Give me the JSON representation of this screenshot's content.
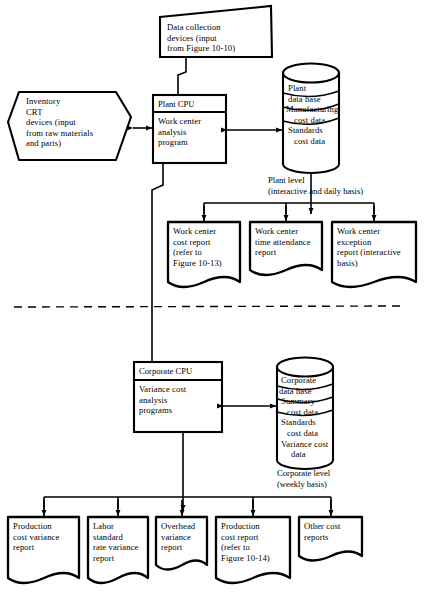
{
  "diagram": {
    "divider_note": "dashed horizontal separator between plant level and corporate level"
  },
  "nodes": {
    "data_collection": {
      "shape": "skewed-parallelogram",
      "lines": [
        "Data collection",
        "devices (input",
        "from Figure 10-10)"
      ]
    },
    "inventory_crt": {
      "shape": "hexagon",
      "lines": [
        "Inventory",
        "CRT",
        "devices (input",
        "from raw materials",
        "and parts)"
      ]
    },
    "plant_cpu": {
      "shape": "process-box",
      "header": "Plant CPU",
      "lines": [
        "Work center",
        "analysis",
        "program"
      ]
    },
    "plant_db": {
      "shape": "cylinder",
      "lines": [
        "Plant",
        "data base",
        "Manufacturing",
        "cost data",
        "Standards",
        "cost data"
      ]
    },
    "plant_level_label": {
      "lines": [
        "Plant level",
        "(interactive and daily basis)"
      ]
    },
    "corporate_cpu": {
      "shape": "process-box",
      "header": "Corporate CPU",
      "lines": [
        "Variance cost",
        "analysis",
        "programs"
      ]
    },
    "corporate_db": {
      "shape": "cylinder",
      "lines": [
        "Corporate",
        "data base",
        "Summary",
        "cost data",
        "Standards",
        "cost data",
        "Variance cost",
        "data"
      ]
    },
    "corporate_level_label": {
      "lines": [
        "Corporate level",
        "(weekly basis)"
      ]
    }
  },
  "plant_reports": [
    {
      "id": "work-center-cost-report",
      "lines": [
        "Work center",
        "cost report",
        "(refer to",
        "Figure 10-13)"
      ]
    },
    {
      "id": "work-center-time-attendance-report",
      "lines": [
        "Work center",
        "time attendance",
        "report"
      ]
    },
    {
      "id": "work-center-exception-report",
      "lines": [
        "Work center",
        "exception",
        "report (interactive",
        "basis)"
      ]
    }
  ],
  "corporate_reports": [
    {
      "id": "production-cost-variance-report",
      "lines": [
        "Production",
        "cost variance",
        "report"
      ]
    },
    {
      "id": "labor-standard-rate-variance-report",
      "lines": [
        "Labor",
        "standard",
        "rate variance",
        "report"
      ]
    },
    {
      "id": "overhead-variance-report",
      "lines": [
        "Overhead",
        "variance",
        "report"
      ]
    },
    {
      "id": "production-cost-report",
      "lines": [
        "Production",
        "cost report",
        "(refer to",
        "Figure 10-14)"
      ]
    },
    {
      "id": "other-cost-reports",
      "lines": [
        "Other cost",
        "reports"
      ]
    }
  ],
  "colors": {
    "stroke": "#000000",
    "background": "#ffffff",
    "thin_stroke": "#1a1a1a"
  }
}
